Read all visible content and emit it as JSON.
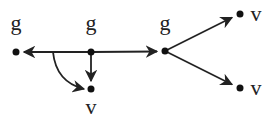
{
  "diagram": {
    "nodes": [
      {
        "id": "n1",
        "label": "g",
        "x": 16,
        "y": 52,
        "label_x": 16,
        "label_y": 30
      },
      {
        "id": "n2",
        "label": "g",
        "x": 91,
        "y": 52,
        "label_x": 91,
        "label_y": 30
      },
      {
        "id": "n3",
        "label": "v",
        "x": 91,
        "y": 89,
        "label_x": 91,
        "label_y": 112
      },
      {
        "id": "n4",
        "label": "g",
        "x": 165,
        "y": 51,
        "label_x": 165,
        "label_y": 30
      },
      {
        "id": "n5",
        "label": "v",
        "x": 240,
        "y": 14,
        "label_x": 256,
        "label_y": 20
      },
      {
        "id": "n6",
        "label": "v",
        "x": 240,
        "y": 88,
        "label_x": 256,
        "label_y": 94
      }
    ],
    "edges": [
      {
        "from": "n2",
        "to": "n1",
        "type": "straight"
      },
      {
        "from": "n2",
        "to": "n4",
        "type": "straight"
      },
      {
        "from": "n2",
        "to": "n3",
        "type": "straight"
      },
      {
        "from": "edge-n2-n1",
        "to": "n3",
        "type": "curved"
      },
      {
        "from": "n4",
        "to": "n5",
        "type": "straight"
      },
      {
        "from": "n4",
        "to": "n6",
        "type": "straight"
      }
    ]
  }
}
